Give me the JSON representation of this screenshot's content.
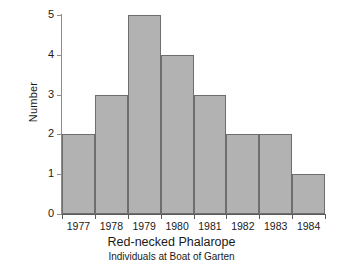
{
  "chart_data": {
    "type": "bar",
    "title": "Red-necked Phalarope",
    "subtitle": "Individuals at Boat of Garten",
    "xlabel": "",
    "ylabel": "Number",
    "categories": [
      "1977",
      "1978",
      "1979",
      "1980",
      "1981",
      "1982",
      "1983",
      "1984"
    ],
    "values": [
      2,
      3,
      5,
      4,
      3,
      2,
      2,
      1
    ],
    "ylim": [
      0,
      5
    ],
    "yticks": [
      "0",
      "1",
      "2",
      "3",
      "4",
      "5"
    ],
    "grid": false,
    "legend": false,
    "bar_fill_color": "#b2b2b2",
    "bar_border_color": "#6e6e6e",
    "background_color": "#ffffff",
    "axis_color": "#5a5a5a"
  }
}
